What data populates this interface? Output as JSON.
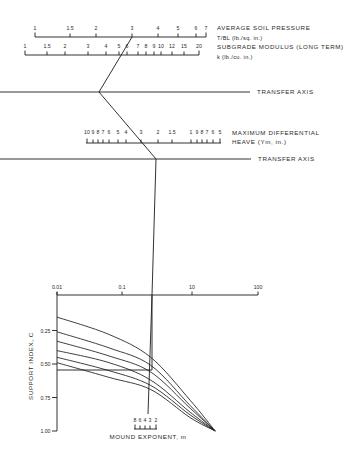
{
  "scales": {
    "soil_pressure": {
      "title": "AVERAGE SOIL PRESSURE",
      "subtitle": "T/BL  (lb./sq. in.)",
      "line_y": 37,
      "x_start": 35,
      "x_end": 206,
      "label_y": 30,
      "tick_dir": "up",
      "ticks": [
        {
          "label": "1",
          "x": 35
        },
        {
          "label": "1.5",
          "x": 70
        },
        {
          "label": "2",
          "x": 96
        },
        {
          "label": "3",
          "x": 132
        },
        {
          "label": "4",
          "x": 158
        },
        {
          "label": "5",
          "x": 178
        },
        {
          "label": "6",
          "x": 196
        },
        {
          "label": "7",
          "x": 206
        }
      ]
    },
    "subgrade_modulus": {
      "title": "SUBGRADE MODULUS (LONG TERM)",
      "subtitle": "k  (lb./cu. in.)",
      "line_y": 55,
      "x_start": 25,
      "x_end": 199,
      "label_y": 48,
      "tick_dir": "up",
      "ticks": [
        {
          "label": "1",
          "x": 25
        },
        {
          "label": "1.5",
          "x": 47
        },
        {
          "label": "2",
          "x": 65
        },
        {
          "label": "3",
          "x": 88
        },
        {
          "label": "4",
          "x": 106
        },
        {
          "label": "5",
          "x": 119
        },
        {
          "label": "6",
          "x": 127
        },
        {
          "label": "7",
          "x": 138
        },
        {
          "label": "8",
          "x": 146
        },
        {
          "label": "9",
          "x": 154
        },
        {
          "label": "10",
          "x": 161
        },
        {
          "label": "12",
          "x": 172
        },
        {
          "label": "15",
          "x": 184
        },
        {
          "label": "20",
          "x": 199
        }
      ]
    },
    "transfer_axis_1": {
      "label": "TRANSFER  AXIS",
      "y": 92,
      "x_end": 250
    },
    "max_differential_heave": {
      "title": "MAXIMUM  DIFFERENTIAL",
      "subtitle": "HEAVE  (Ym, in.)",
      "line_y": 143,
      "x_start": 86,
      "x_end": 221,
      "label_y": 134,
      "tick_dir": "up",
      "ticks": [
        {
          "label": "10",
          "x": 87
        },
        {
          "label": "9",
          "x": 93
        },
        {
          "label": "8",
          "x": 98
        },
        {
          "label": "7",
          "x": 103
        },
        {
          "label": "6",
          "x": 109
        },
        {
          "label": "5",
          "x": 118
        },
        {
          "label": "4",
          "x": 126
        },
        {
          "label": "3",
          "x": 141
        },
        {
          "label": "2",
          "x": 158
        },
        {
          "label": "1.5",
          "x": 172
        },
        {
          "label": "1",
          "x": 191
        },
        {
          "label": "9",
          "x": 197
        },
        {
          "label": "8",
          "x": 202
        },
        {
          "label": "7",
          "x": 207
        },
        {
          "label": "6",
          "x": 213
        },
        {
          "label": "5",
          "x": 220
        }
      ]
    },
    "transfer_axis_2": {
      "label": "TRANSFER  AXIS",
      "y": 159,
      "x_end": 251
    },
    "mound_exponent": {
      "title": "MOUND  EXPONENT,  m",
      "line_y": 429,
      "x_start": 134,
      "x_end": 157,
      "label_y": 422,
      "tick_dir": "up",
      "ticks": [
        {
          "label": "8",
          "x": 135
        },
        {
          "label": "6",
          "x": 140
        },
        {
          "label": "4",
          "x": 145
        },
        {
          "label": "3",
          "x": 150
        },
        {
          "label": "2",
          "x": 156
        }
      ]
    }
  },
  "solution_path": {
    "main": [
      [
        132,
        37
      ],
      [
        99,
        92
      ],
      [
        156,
        159
      ],
      [
        152,
        295
      ],
      [
        152,
        370
      ],
      [
        57,
        370
      ]
    ],
    "to_mound_exponent": [
      [
        152,
        295
      ],
      [
        148,
        414
      ]
    ]
  },
  "chart_data": {
    "type": "line",
    "title": "",
    "xlabel": "",
    "ylabel": "SUPPORT  INDEX,  C",
    "x_scale": "log",
    "x_ticks": [
      {
        "label": "0.01",
        "value": 0.01
      },
      {
        "label": "0.1",
        "value": 0.1
      },
      {
        "label": "10",
        "value": 1
      },
      {
        "label": "100",
        "value": 10
      }
    ],
    "y_ticks": [
      {
        "label": "0.25",
        "value": 0.25
      },
      {
        "label": "0.50",
        "value": 0.5
      },
      {
        "label": "0.75",
        "value": 0.75
      },
      {
        "label": "1.00",
        "value": 1.0
      }
    ],
    "ylim": [
      0,
      1.0
    ],
    "y_inverted": true,
    "x_axis_position": "top",
    "grid": false,
    "legend": "none",
    "x": [
      0.01,
      0.06,
      0.25,
      0.97,
      2.3
    ],
    "series": [
      {
        "name": "curve 1",
        "values": [
          0.15,
          0.28,
          0.45,
          0.77,
          1.0
        ]
      },
      {
        "name": "curve 2",
        "values": [
          0.26,
          0.38,
          0.51,
          0.81,
          1.0
        ]
      },
      {
        "name": "curve 3",
        "values": [
          0.33,
          0.44,
          0.56,
          0.83,
          1.0
        ]
      },
      {
        "name": "curve 4",
        "values": [
          0.4,
          0.49,
          0.62,
          0.86,
          1.0
        ]
      },
      {
        "name": "curve 5",
        "values": [
          0.45,
          0.55,
          0.66,
          0.88,
          1.0
        ]
      },
      {
        "name": "curve 6",
        "values": [
          0.49,
          0.6,
          0.69,
          0.9,
          1.0
        ]
      }
    ]
  }
}
